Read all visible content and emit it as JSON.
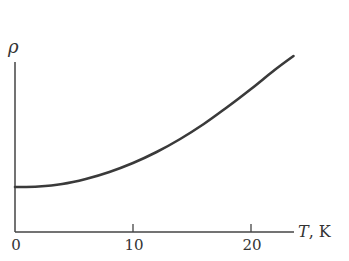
{
  "chart_data": {
    "type": "line",
    "title": "",
    "xlabel": "T, K",
    "ylabel": "ρ",
    "x_ticks": [
      0,
      10,
      20
    ],
    "x_tick_labels": [
      "0",
      "10",
      "20"
    ],
    "y_ticks": [],
    "xlim": [
      0,
      24
    ],
    "ylim": [
      0,
      180
    ],
    "grid": false,
    "legend": null,
    "series": [
      {
        "name": "resistivity",
        "color": "#3a3a3a",
        "x": [
          0,
          2,
          4,
          6,
          8,
          10,
          12,
          14,
          16,
          18,
          20,
          22,
          23.6
        ],
        "values": [
          45,
          45.5,
          48,
          53,
          60,
          69,
          80,
          93,
          108,
          125,
          143,
          162,
          176
        ]
      }
    ]
  },
  "labels": {
    "y_axis": "ρ",
    "x_axis_var": "T",
    "x_axis_unit": ", K",
    "tick_0": "0",
    "tick_10": "10",
    "tick_20": "20"
  }
}
